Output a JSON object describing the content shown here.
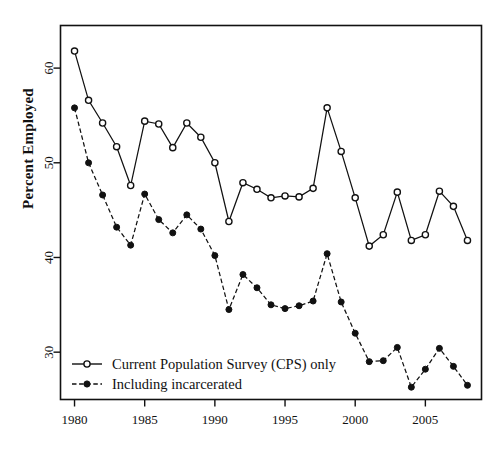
{
  "chart_data": {
    "type": "line",
    "title": "",
    "xlabel": "",
    "ylabel": "Percent Employed",
    "xlim": [
      1979.0,
      2009.0
    ],
    "ylim": [
      25.0,
      64.5
    ],
    "xticks": [
      1980,
      1985,
      1990,
      1995,
      2000,
      2005
    ],
    "yticks": [
      30,
      40,
      50,
      60
    ],
    "xtick_labels": [
      "1980",
      "1985",
      "1990",
      "1995",
      "2000",
      "2005"
    ],
    "ytick_labels": [
      "30",
      "40",
      "50",
      "60"
    ],
    "grid": false,
    "legend_position": "lower-left inside axes",
    "x": [
      1980,
      1981,
      1982,
      1983,
      1984,
      1985,
      1986,
      1987,
      1988,
      1989,
      1990,
      1991,
      1992,
      1993,
      1994,
      1995,
      1996,
      1997,
      1998,
      1999,
      2000,
      2001,
      2002,
      2003,
      2004,
      2005,
      2006,
      2007,
      2008
    ],
    "series": [
      {
        "name": "Current Population Survey (CPS) only",
        "marker": "open-circle",
        "line": "solid",
        "values": [
          61.8,
          56.6,
          54.2,
          51.7,
          47.6,
          54.4,
          54.1,
          51.6,
          54.2,
          52.7,
          50.0,
          43.8,
          47.9,
          47.2,
          46.3,
          46.5,
          46.4,
          47.3,
          55.8,
          51.2,
          46.3,
          41.2,
          42.4,
          46.9,
          41.8,
          42.4,
          47.0,
          45.4,
          41.8
        ]
      },
      {
        "name": "Including incarcerated",
        "marker": "filled-circle",
        "line": "dashed",
        "values": [
          55.8,
          50.0,
          46.6,
          43.2,
          41.3,
          46.7,
          44.0,
          42.6,
          44.5,
          43.0,
          40.2,
          34.5,
          38.2,
          36.8,
          35.0,
          34.6,
          34.9,
          35.4,
          40.4,
          35.3,
          32.0,
          29.0,
          29.1,
          30.5,
          26.3,
          28.2,
          30.4,
          28.5,
          26.5
        ]
      }
    ]
  },
  "legend": {
    "entries": [
      {
        "label": "Current Population Survey (CPS) only",
        "marker": "open-circle"
      },
      {
        "label": "Including incarcerated",
        "marker": "filled-circle"
      }
    ]
  },
  "axes": {
    "ylabel": "Percent Employed"
  }
}
